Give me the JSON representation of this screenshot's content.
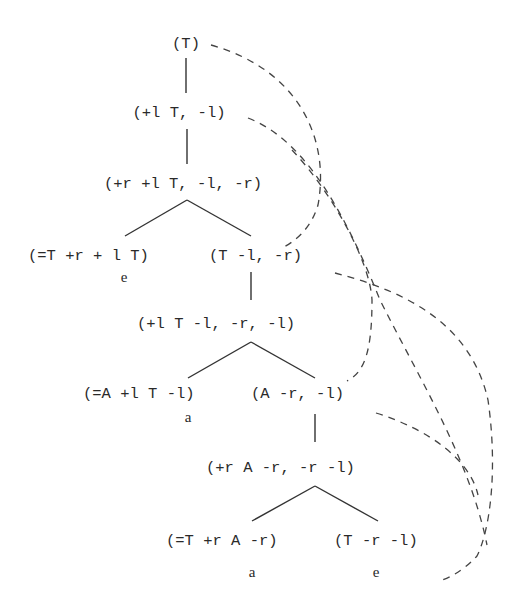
{
  "diagram": {
    "nodes": [
      {
        "id": "n0",
        "text": "(T)"
      },
      {
        "id": "n1",
        "text": "(+l T, -l)"
      },
      {
        "id": "n2",
        "text": "(+r +l T, -l, -r)"
      },
      {
        "id": "n3a",
        "text": "(=T +r + l T)"
      },
      {
        "id": "n3b",
        "text": "(T -l, -r)"
      },
      {
        "id": "n4",
        "text": "(+l T -l, -r, -l)"
      },
      {
        "id": "n5a",
        "text": "(=A +l T -l)"
      },
      {
        "id": "n5b",
        "text": "(A -r, -l)"
      },
      {
        "id": "n6",
        "text": "(+r A -r, -r -l)"
      },
      {
        "id": "n7a",
        "text": "(=T +r A -r)"
      },
      {
        "id": "n7b",
        "text": "(T -r -l)"
      }
    ],
    "leaf_labels": [
      {
        "attached_to": "n3a",
        "text": "e"
      },
      {
        "attached_to": "n5a",
        "text": "a"
      },
      {
        "attached_to": "n7a",
        "text": "a"
      },
      {
        "attached_to": "n7b",
        "text": "e"
      }
    ],
    "tree_edges": [
      {
        "from": "n0",
        "to": "n1"
      },
      {
        "from": "n1",
        "to": "n2"
      },
      {
        "from": "n2",
        "to": "n3a"
      },
      {
        "from": "n2",
        "to": "n3b"
      },
      {
        "from": "n3b",
        "to": "n4"
      },
      {
        "from": "n4",
        "to": "n5a"
      },
      {
        "from": "n4",
        "to": "n5b"
      },
      {
        "from": "n5b",
        "to": "n6"
      },
      {
        "from": "n6",
        "to": "n7a"
      },
      {
        "from": "n6",
        "to": "n7b"
      }
    ],
    "dashed_links": [
      {
        "from": "n0",
        "to": "n3b"
      },
      {
        "from": "n1",
        "to": "n7b"
      },
      {
        "from": "n2",
        "to": "n5b"
      },
      {
        "from": "n3b",
        "to": "n7b"
      },
      {
        "from": "n5b",
        "to": "n7b"
      }
    ]
  }
}
